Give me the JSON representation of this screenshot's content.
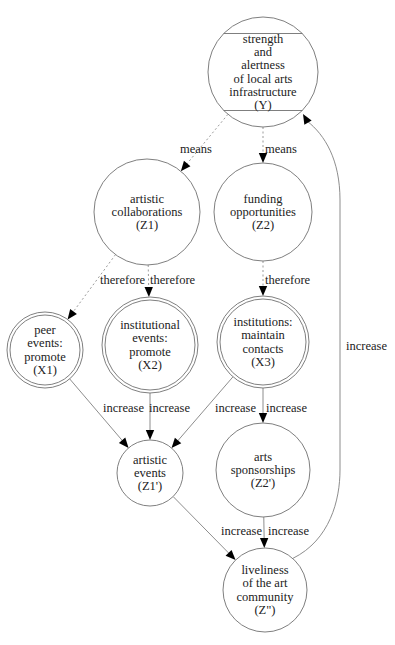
{
  "diagram": {
    "nodes": [
      {
        "id": "Y",
        "shape": "Mcircle",
        "lines": [
          "strength",
          "and",
          "alertness",
          "of local arts",
          "infrastructure",
          "(Y)"
        ]
      },
      {
        "id": "Z1",
        "shape": "circle",
        "lines": [
          "artistic",
          "collaborations",
          "(Z1)"
        ]
      },
      {
        "id": "Z2",
        "shape": "circle",
        "lines": [
          "funding",
          "opportunities",
          "(Z2)"
        ]
      },
      {
        "id": "X1",
        "shape": "doublecircle",
        "lines": [
          "peer",
          "events:",
          "promote",
          "(X1)"
        ]
      },
      {
        "id": "X2",
        "shape": "doublecircle",
        "lines": [
          "institutional",
          "events:",
          "promote",
          "(X2)"
        ]
      },
      {
        "id": "X3",
        "shape": "doublecircle",
        "lines": [
          "institutions:",
          "maintain",
          "contacts",
          "(X3)"
        ]
      },
      {
        "id": "Z1p",
        "shape": "circle",
        "lines": [
          "artistic",
          "events",
          "(Z1')"
        ]
      },
      {
        "id": "Z2p",
        "shape": "circle",
        "lines": [
          "arts",
          "sponsorships",
          "(Z2')"
        ]
      },
      {
        "id": "Zpp",
        "shape": "circle",
        "lines": [
          "liveliness",
          "of the art",
          "community",
          "(Z\")"
        ]
      }
    ],
    "edges": [
      {
        "from": "Y",
        "to": "Z1",
        "label": "means",
        "style": "dotted"
      },
      {
        "from": "Y",
        "to": "Z2",
        "label": "means",
        "style": "dotted"
      },
      {
        "from": "Z1",
        "to": "X1",
        "label": "therefore",
        "style": "dotted"
      },
      {
        "from": "Z1",
        "to": "X2",
        "label": "therefore",
        "style": "dotted"
      },
      {
        "from": "Z2",
        "to": "X3",
        "label": "therefore",
        "style": "dotted"
      },
      {
        "from": "X1",
        "to": "Z1p",
        "label": "increase",
        "style": "solid"
      },
      {
        "from": "X2",
        "to": "Z1p",
        "label": "increase",
        "style": "solid"
      },
      {
        "from": "X3",
        "to": "Z1p",
        "label": "increase",
        "style": "solid"
      },
      {
        "from": "X3",
        "to": "Z2p",
        "label": "increase",
        "style": "solid"
      },
      {
        "from": "Z1p",
        "to": "Zpp",
        "label": "increase",
        "style": "solid"
      },
      {
        "from": "Z2p",
        "to": "Zpp",
        "label": "increase",
        "style": "solid"
      },
      {
        "from": "Zpp",
        "to": "Y",
        "label": "increase",
        "style": "solid"
      }
    ]
  }
}
